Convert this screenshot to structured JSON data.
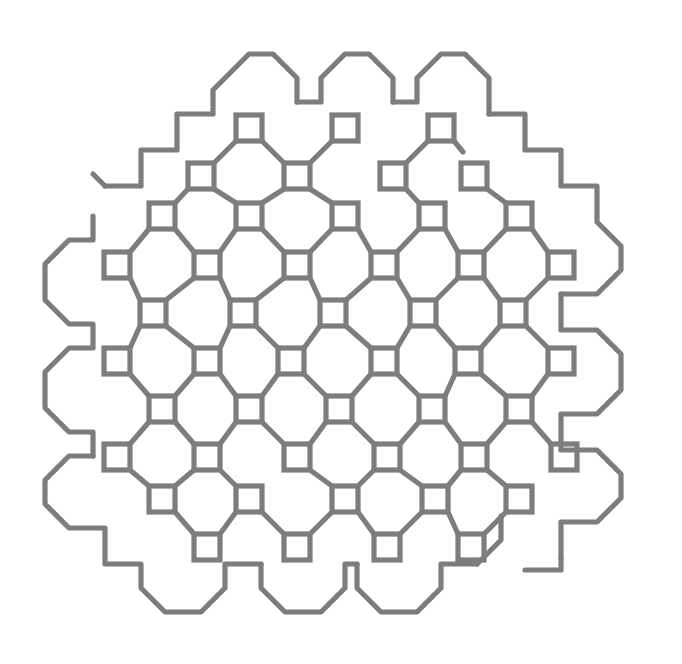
{
  "artwork": {
    "title": "Maze Lattice Pattern",
    "type": "generative-line-art",
    "canvas": {
      "width": 682,
      "height": 664,
      "background": "#ffffff"
    },
    "style": {
      "stroke_color": "#7d7d7d",
      "stroke_width": 5.2,
      "fill": "none"
    },
    "grid": {
      "pitch": 48,
      "origin_x": 105,
      "origin_y": 73,
      "node_size": 26,
      "columns": 12,
      "rows": 12
    },
    "nodes": [
      {
        "cx": 249,
        "cy": 128
      },
      {
        "cx": 345,
        "cy": 128
      },
      {
        "cx": 441,
        "cy": 128
      },
      {
        "cx": 201,
        "cy": 176
      },
      {
        "cx": 297,
        "cy": 176
      },
      {
        "cx": 393,
        "cy": 176
      },
      {
        "cx": 474,
        "cy": 176
      },
      {
        "cx": 162,
        "cy": 216
      },
      {
        "cx": 249,
        "cy": 216
      },
      {
        "cx": 345,
        "cy": 216
      },
      {
        "cx": 432,
        "cy": 216
      },
      {
        "cx": 519,
        "cy": 216
      },
      {
        "cx": 117,
        "cy": 265
      },
      {
        "cx": 207,
        "cy": 265
      },
      {
        "cx": 297,
        "cy": 265
      },
      {
        "cx": 384,
        "cy": 265
      },
      {
        "cx": 471,
        "cy": 265
      },
      {
        "cx": 561,
        "cy": 265
      },
      {
        "cx": 153,
        "cy": 313
      },
      {
        "cx": 243,
        "cy": 313
      },
      {
        "cx": 333,
        "cy": 313
      },
      {
        "cx": 423,
        "cy": 313
      },
      {
        "cx": 513,
        "cy": 313
      },
      {
        "cx": 117,
        "cy": 361
      },
      {
        "cx": 207,
        "cy": 361
      },
      {
        "cx": 291,
        "cy": 361
      },
      {
        "cx": 384,
        "cy": 361
      },
      {
        "cx": 468,
        "cy": 361
      },
      {
        "cx": 561,
        "cy": 361
      },
      {
        "cx": 162,
        "cy": 409
      },
      {
        "cx": 249,
        "cy": 409
      },
      {
        "cx": 339,
        "cy": 409
      },
      {
        "cx": 432,
        "cy": 409
      },
      {
        "cx": 519,
        "cy": 409
      },
      {
        "cx": 117,
        "cy": 457
      },
      {
        "cx": 207,
        "cy": 457
      },
      {
        "cx": 297,
        "cy": 457
      },
      {
        "cx": 387,
        "cy": 457
      },
      {
        "cx": 474,
        "cy": 457
      },
      {
        "cx": 564,
        "cy": 457
      },
      {
        "cx": 162,
        "cy": 499
      },
      {
        "cx": 249,
        "cy": 499
      },
      {
        "cx": 345,
        "cy": 499
      },
      {
        "cx": 435,
        "cy": 499
      },
      {
        "cx": 519,
        "cy": 499
      },
      {
        "cx": 207,
        "cy": 547
      },
      {
        "cx": 297,
        "cy": 547
      },
      {
        "cx": 387,
        "cy": 547
      },
      {
        "cx": 471,
        "cy": 547
      }
    ],
    "connector_count": 62,
    "boundary": {
      "shape": "octagonal-meander",
      "description": "stepped perimeter with octagonal bumps along top and bottom edges"
    }
  }
}
